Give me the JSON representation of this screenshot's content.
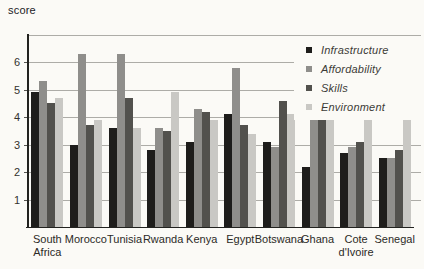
{
  "page": {
    "background": "#fbfaf6"
  },
  "chart_data": {
    "type": "bar",
    "title": "",
    "ylabel": "score",
    "xlabel": "",
    "categories": [
      "South Africa",
      "Morocco",
      "Tunisia",
      "Rwanda",
      "Kenya",
      "Egypt",
      "Botswana",
      "Ghana",
      "Cote d'Ivoire",
      "Senegal"
    ],
    "series": [
      {
        "name": "Infrastructure",
        "color": "#1e1d1b",
        "values": [
          4.9,
          3.0,
          3.6,
          2.8,
          3.1,
          4.1,
          3.1,
          2.2,
          2.7,
          2.5
        ]
      },
      {
        "name": "Affordability",
        "color": "#8f8e8b",
        "values": [
          5.3,
          6.3,
          6.3,
          3.6,
          4.3,
          5.8,
          2.9,
          4.2,
          2.9,
          2.5
        ]
      },
      {
        "name": "Skills",
        "color": "#52514d",
        "values": [
          4.5,
          3.7,
          4.7,
          3.5,
          4.2,
          3.7,
          4.6,
          4.2,
          3.1,
          2.8
        ]
      },
      {
        "name": "Environment",
        "color": "#c9c8c4",
        "values": [
          4.7,
          3.9,
          3.6,
          4.9,
          3.9,
          3.4,
          4.1,
          4.1,
          4.0,
          3.9
        ]
      }
    ],
    "ylim": [
      0,
      7
    ],
    "yticks": [
      1,
      2,
      3,
      4,
      5,
      6
    ],
    "grid": true,
    "legend_position": "top-right",
    "colors": {
      "axis": "#22221f",
      "grid": "#adaca7",
      "tick_text": "#33322e",
      "legend_text": "#3c3b36"
    }
  }
}
